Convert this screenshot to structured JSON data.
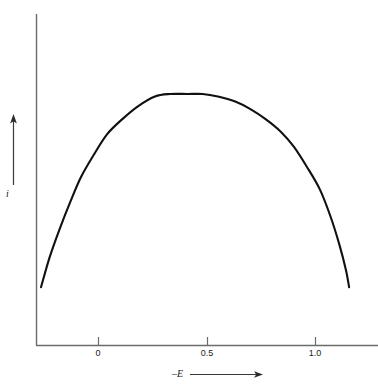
{
  "figure": {
    "background_color": "#ffffff",
    "axis_color": "#6b6b6b",
    "curve_color": "#111111",
    "text_color": "#1a1a1a"
  },
  "axes": {
    "y_axis_label": "i",
    "x_axis_label": "–E",
    "x_tick_labels": [
      "0",
      "0.5",
      "1.0"
    ],
    "x_arrow_name": "x-axis-direction-arrow",
    "y_arrow_name": "y-axis-direction-arrow"
  },
  "chart_data": {
    "type": "line",
    "title": "",
    "subtitle": "",
    "xlabel": "–E",
    "ylabel": "i",
    "xlim": [
      -0.28,
      1.57
    ],
    "ylim": [
      0,
      1.22
    ],
    "xticks": [
      0,
      0.5,
      1.0
    ],
    "xticklabels": [
      "0",
      "0.5",
      "1.0"
    ],
    "yticks": [],
    "yticklabels": [],
    "grid": false,
    "legend": null,
    "annotations": [],
    "series": [
      {
        "name": "peak current",
        "x": [
          -0.265,
          -0.225,
          -0.18,
          -0.13,
          -0.08,
          -0.02,
          0.04,
          0.11,
          0.18,
          0.26,
          0.33,
          0.41,
          0.48,
          0.55,
          0.63,
          0.7,
          0.77,
          0.84,
          0.9,
          0.96,
          1.02,
          1.07,
          1.11,
          1.14,
          1.155
        ],
        "y": [
          0.23,
          0.35,
          0.46,
          0.57,
          0.67,
          0.76,
          0.84,
          0.9,
          0.95,
          0.99,
          1.0,
          1.0,
          1.0,
          0.99,
          0.97,
          0.94,
          0.9,
          0.85,
          0.79,
          0.71,
          0.62,
          0.51,
          0.4,
          0.3,
          0.23
        ]
      }
    ],
    "peak": {
      "x": 0.46,
      "y": 1.0
    }
  }
}
